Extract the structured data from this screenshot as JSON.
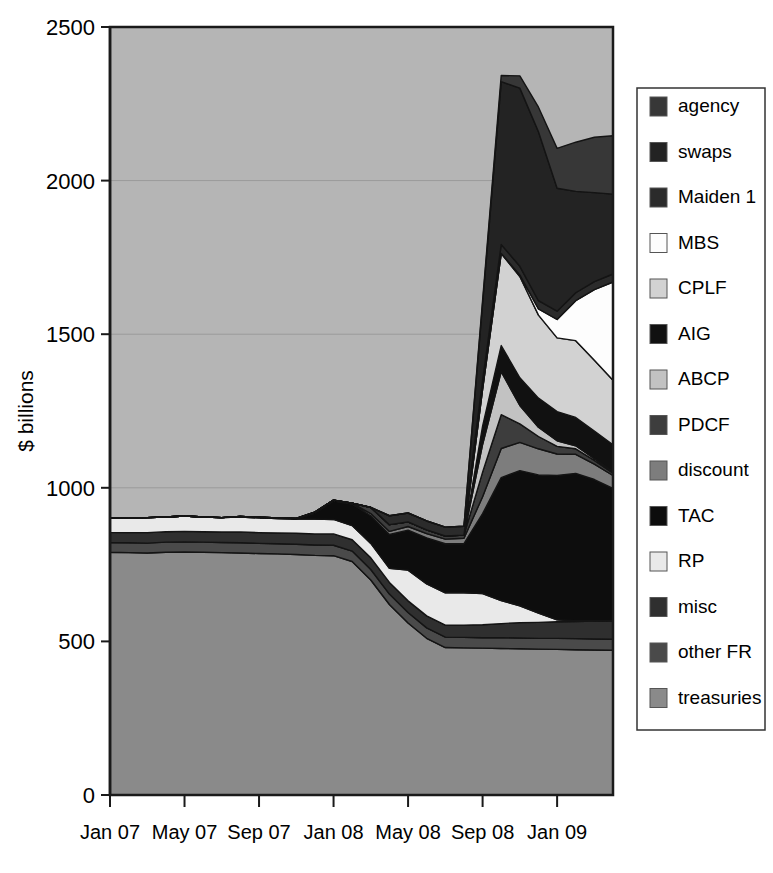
{
  "chart_data": {
    "type": "area",
    "stacked": true,
    "title": "",
    "xlabel": "",
    "ylabel": "$ billions",
    "ylim": [
      0,
      2500
    ],
    "yticks": [
      0,
      500,
      1000,
      1500,
      2000,
      2500
    ],
    "ytick_labels": [
      "0",
      "500",
      "1000",
      "1500",
      "2000",
      "2500"
    ],
    "grid": true,
    "grid_axis": "y",
    "legend_position": "right",
    "plot_bgcolor": "#b5b5b5",
    "x": [
      "Jan 07",
      "Feb 07",
      "Mar 07",
      "Apr 07",
      "May 07",
      "Jun 07",
      "Jul 07",
      "Aug 07",
      "Sep 07",
      "Oct 07",
      "Nov 07",
      "Dec 07",
      "Jan 08",
      "Feb 08",
      "Mar 08",
      "Apr 08",
      "May 08",
      "Jun 08",
      "Jul 08",
      "Aug 08",
      "Sep 08",
      "Oct 08",
      "Nov 08",
      "Dec 08",
      "Jan 09",
      "Feb 09",
      "Mar 09",
      "Apr 09"
    ],
    "xticks": [
      "Jan 07",
      "May 07",
      "Sep 07",
      "Jan 08",
      "May 08",
      "Sep 08",
      "Jan 09"
    ],
    "xtick_index": [
      0,
      4,
      8,
      12,
      16,
      20,
      24
    ],
    "series": [
      {
        "name": "treasuries",
        "color": "#8a8a8a",
        "values": [
          790,
          789,
          788,
          790,
          791,
          790,
          789,
          788,
          786,
          785,
          783,
          780,
          779,
          760,
          700,
          620,
          560,
          510,
          480,
          479,
          478,
          477,
          476,
          475,
          474,
          473,
          472,
          471
        ]
      },
      {
        "name": "other FR",
        "color": "#4a4a4a",
        "values": [
          32,
          32,
          32,
          33,
          33,
          33,
          33,
          33,
          33,
          33,
          33,
          34,
          34,
          34,
          34,
          34,
          34,
          34,
          34,
          34,
          34,
          35,
          35,
          35,
          36,
          36,
          36,
          36
        ]
      },
      {
        "name": "misc",
        "color": "#2f2f2f",
        "values": [
          33,
          33,
          34,
          34,
          34,
          34,
          34,
          35,
          35,
          35,
          36,
          36,
          37,
          37,
          38,
          38,
          38,
          39,
          39,
          40,
          42,
          46,
          50,
          52,
          54,
          56,
          58,
          60
        ]
      },
      {
        "name": "RP",
        "color": "#e9e9e9",
        "values": [
          48,
          47,
          49,
          48,
          50,
          48,
          47,
          49,
          48,
          47,
          46,
          48,
          47,
          46,
          47,
          46,
          100,
          104,
          105,
          105,
          102,
          75,
          55,
          30,
          6,
          2,
          1,
          1
        ]
      },
      {
        "name": "TAC",
        "color": "#0d0d0d",
        "values": [
          0,
          0,
          0,
          0,
          0,
          0,
          0,
          0,
          0,
          0,
          0,
          20,
          60,
          70,
          90,
          110,
          130,
          150,
          160,
          160,
          260,
          400,
          440,
          450,
          470,
          480,
          460,
          430
        ]
      },
      {
        "name": "discount",
        "color": "#7d7d7d",
        "values": [
          0,
          0,
          0,
          0,
          0,
          0,
          0,
          2,
          2,
          2,
          2,
          3,
          3,
          3,
          7,
          10,
          12,
          14,
          15,
          18,
          55,
          95,
          92,
          85,
          70,
          62,
          50,
          42
        ]
      },
      {
        "name": "PDCF",
        "color": "#3d3d3d",
        "values": [
          0,
          0,
          0,
          0,
          0,
          0,
          0,
          0,
          0,
          0,
          0,
          0,
          0,
          0,
          20,
          22,
          15,
          12,
          10,
          10,
          80,
          110,
          60,
          40,
          25,
          18,
          12,
          8
        ]
      },
      {
        "name": "ABCP",
        "color": "#c2c2c2",
        "values": [
          0,
          0,
          0,
          0,
          0,
          0,
          0,
          0,
          0,
          0,
          0,
          0,
          0,
          0,
          0,
          0,
          0,
          0,
          0,
          0,
          90,
          140,
          60,
          30,
          18,
          10,
          6,
          4
        ]
      },
      {
        "name": "AIG",
        "color": "#111111",
        "values": [
          0,
          0,
          0,
          0,
          0,
          0,
          0,
          0,
          0,
          0,
          0,
          0,
          0,
          0,
          0,
          0,
          0,
          0,
          0,
          0,
          60,
          85,
          90,
          95,
          95,
          92,
          90,
          88
        ]
      },
      {
        "name": "CPLF",
        "color": "#d2d2d2",
        "values": [
          0,
          0,
          0,
          0,
          0,
          0,
          0,
          0,
          0,
          0,
          0,
          0,
          0,
          0,
          0,
          0,
          0,
          0,
          0,
          0,
          120,
          300,
          330,
          270,
          240,
          250,
          230,
          210
        ]
      },
      {
        "name": "MBS",
        "color": "#fdfdfd",
        "values": [
          0,
          0,
          0,
          0,
          0,
          0,
          0,
          0,
          0,
          0,
          0,
          0,
          0,
          0,
          0,
          0,
          0,
          0,
          0,
          0,
          0,
          0,
          5,
          20,
          60,
          130,
          230,
          320
        ]
      },
      {
        "name": "Maiden 1",
        "color": "#2b2b2b",
        "values": [
          0,
          0,
          0,
          0,
          0,
          0,
          0,
          0,
          0,
          0,
          0,
          0,
          0,
          0,
          0,
          29,
          29,
          29,
          29,
          29,
          29,
          29,
          28,
          27,
          27,
          26,
          26,
          26
        ]
      },
      {
        "name": "swaps",
        "color": "#232323",
        "values": [
          0,
          0,
          0,
          0,
          0,
          0,
          0,
          0,
          0,
          0,
          0,
          0,
          0,
          0,
          0,
          0,
          0,
          0,
          0,
          0,
          250,
          530,
          580,
          550,
          400,
          330,
          290,
          260
        ]
      },
      {
        "name": "agency",
        "color": "#373737",
        "values": [
          0,
          0,
          0,
          0,
          0,
          0,
          0,
          0,
          0,
          0,
          0,
          0,
          0,
          0,
          0,
          0,
          0,
          0,
          0,
          0,
          10,
          20,
          40,
          80,
          130,
          160,
          180,
          190
        ]
      }
    ],
    "legend_items": [
      {
        "label": "agency",
        "color": "#373737"
      },
      {
        "label": "swaps",
        "color": "#232323"
      },
      {
        "label": "Maiden 1",
        "color": "#2b2b2b"
      },
      {
        "label": "MBS",
        "color": "#fdfdfd"
      },
      {
        "label": "CPLF",
        "color": "#d2d2d2"
      },
      {
        "label": "AIG",
        "color": "#111111"
      },
      {
        "label": "ABCP",
        "color": "#c2c2c2"
      },
      {
        "label": "PDCF",
        "color": "#3d3d3d"
      },
      {
        "label": "discount",
        "color": "#7d7d7d"
      },
      {
        "label": "TAC",
        "color": "#0d0d0d"
      },
      {
        "label": "RP",
        "color": "#e9e9e9"
      },
      {
        "label": "misc",
        "color": "#2f2f2f"
      },
      {
        "label": "other FR",
        "color": "#4a4a4a"
      },
      {
        "label": "treasuries",
        "color": "#8a8a8a"
      }
    ]
  }
}
